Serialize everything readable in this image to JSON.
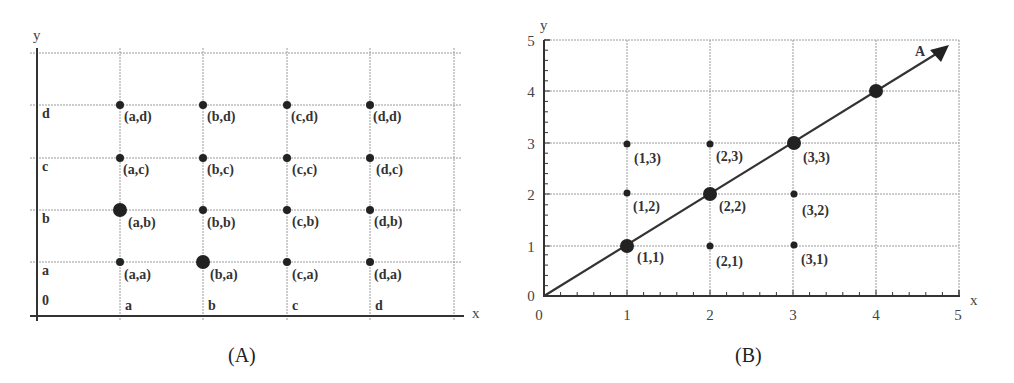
{
  "panel_a": {
    "caption": "(A)",
    "x_axis_label": "x",
    "y_axis_label": "y",
    "origin_label": "0",
    "x_tick_labels": [
      "a",
      "b",
      "c",
      "d"
    ],
    "y_tick_labels": [
      "a",
      "b",
      "c",
      "d"
    ],
    "points": [
      {
        "label": "(a,a)",
        "x": "a",
        "y": "a",
        "size": "small"
      },
      {
        "label": "(b,a)",
        "x": "b",
        "y": "a",
        "size": "large"
      },
      {
        "label": "(c,a)",
        "x": "c",
        "y": "a",
        "size": "small"
      },
      {
        "label": "(d,a)",
        "x": "d",
        "y": "a",
        "size": "small"
      },
      {
        "label": "(a,b)",
        "x": "a",
        "y": "b",
        "size": "large"
      },
      {
        "label": "(b,b)",
        "x": "b",
        "y": "b",
        "size": "small"
      },
      {
        "label": "(c,b)",
        "x": "c",
        "y": "b",
        "size": "small"
      },
      {
        "label": "(d,b)",
        "x": "d",
        "y": "b",
        "size": "small"
      },
      {
        "label": "(a,c)",
        "x": "a",
        "y": "c",
        "size": "small"
      },
      {
        "label": "(b,c)",
        "x": "b",
        "y": "c",
        "size": "small"
      },
      {
        "label": "(c,c)",
        "x": "c",
        "y": "c",
        "size": "small"
      },
      {
        "label": "(d,c)",
        "x": "d",
        "y": "c",
        "size": "small"
      },
      {
        "label": "(a,d)",
        "x": "a",
        "y": "d",
        "size": "small"
      },
      {
        "label": "(b,d)",
        "x": "b",
        "y": "d",
        "size": "small"
      },
      {
        "label": "(c,d)",
        "x": "c",
        "y": "d",
        "size": "small"
      },
      {
        "label": "(d,d)",
        "x": "d",
        "y": "d",
        "size": "small"
      }
    ]
  },
  "panel_b": {
    "caption": "(B)",
    "x_axis_label": "x",
    "y_axis_label": "y",
    "x_tick_labels": [
      "0",
      "1",
      "2",
      "3",
      "4",
      "5"
    ],
    "y_tick_labels": [
      "0",
      "1",
      "2",
      "3",
      "4",
      "5"
    ],
    "vector_label": "A",
    "vector": {
      "from": [
        0,
        0
      ],
      "to": [
        5,
        5
      ]
    },
    "points": [
      {
        "label": "(1,1)",
        "x": 1,
        "y": 1,
        "size": "large"
      },
      {
        "label": "(2,1)",
        "x": 2,
        "y": 1,
        "size": "small"
      },
      {
        "label": "(3,1)",
        "x": 3,
        "y": 1,
        "size": "small"
      },
      {
        "label": "(1,2)",
        "x": 1,
        "y": 2,
        "size": "small"
      },
      {
        "label": "(2,2)",
        "x": 2,
        "y": 2,
        "size": "large"
      },
      {
        "label": "(3,2)",
        "x": 3,
        "y": 2,
        "size": "small"
      },
      {
        "label": "(1,3)",
        "x": 1,
        "y": 3,
        "size": "small"
      },
      {
        "label": "(2,3)",
        "x": 2,
        "y": 3,
        "size": "small"
      },
      {
        "label": "(3,3)",
        "x": 3,
        "y": 3,
        "size": "large"
      },
      {
        "label": "",
        "x": 4,
        "y": 4,
        "size": "large"
      }
    ]
  }
}
